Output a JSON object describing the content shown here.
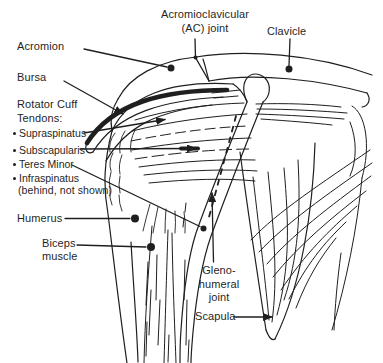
{
  "figure_type": "anatomical line diagram of the shoulder joint",
  "colors": {
    "ink": "#1f1f1f",
    "background": "#ffffff"
  },
  "labels": {
    "ac_joint_line1": "Acromioclavicular",
    "ac_joint_line2": "(AC) joint",
    "clavicle": "Clavicle",
    "acromion": "Acromion",
    "bursa": "Bursa",
    "rotator_cuff_line1": "Rotator Cuff",
    "rotator_cuff_line2": "Tendons:",
    "humerus": "Humerus",
    "biceps_line1": "Biceps",
    "biceps_line2": "muscle",
    "glenohumeral_line1": "Gleno-",
    "glenohumeral_line2": "humeral",
    "glenohumeral_line3": "joint",
    "scapula": "Scapula"
  },
  "rotator_cuff_tendons": [
    {
      "label": "Supraspinatus"
    },
    {
      "label": "Subscapularis"
    },
    {
      "label": "Teres Minor"
    },
    {
      "label": "Infraspinatus",
      "note": "(behind, not shown)"
    }
  ]
}
